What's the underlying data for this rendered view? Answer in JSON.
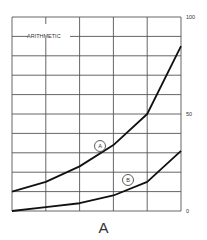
{
  "chart_data": {
    "type": "line",
    "title": "ARITHMETIC",
    "caption": "A",
    "xlabel": "",
    "ylabel": "",
    "ylim": [
      0,
      100
    ],
    "y_ticks": [
      0,
      50,
      100
    ],
    "grid": true,
    "x": [
      0,
      1,
      2,
      3,
      4,
      5
    ],
    "series": [
      {
        "name": "A",
        "values": [
          10,
          15,
          23,
          34,
          50,
          85
        ]
      },
      {
        "name": "B",
        "values": [
          0,
          2,
          4,
          8,
          15,
          31
        ]
      }
    ],
    "legend_position": "inline circled labels"
  },
  "colors": {
    "line": "#111111",
    "grid": "#555555",
    "text": "#333333"
  }
}
